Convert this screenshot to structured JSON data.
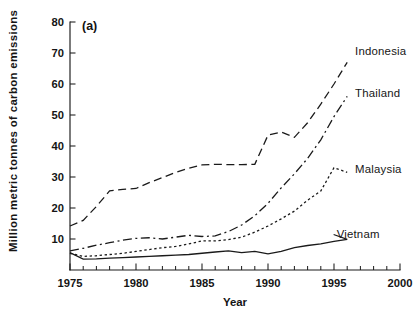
{
  "figure": {
    "panel_label": "(a)"
  },
  "chart_data": {
    "type": "line",
    "title": "",
    "panel": "(a)",
    "xlabel": "Year",
    "ylabel": "Million metric tonnes of carbon emissions",
    "xlim": [
      1975,
      2000
    ],
    "ylim": [
      0,
      80
    ],
    "xticks": [
      1975,
      1980,
      1985,
      1990,
      1995,
      2000
    ],
    "xticklabels": [
      "1975",
      "1980",
      "1985",
      "1990",
      "1995",
      "2000"
    ],
    "yticks": [
      10,
      20,
      30,
      40,
      50,
      60,
      70,
      80
    ],
    "yticklabels": [
      "10",
      "20",
      "30",
      "40",
      "50",
      "60",
      "70",
      "80"
    ],
    "x_minor_tick_interval": 1,
    "grid": false,
    "legend_position": "right-inline-labels",
    "series": [
      {
        "name": "Indonesia",
        "label": "Indonesia",
        "dash": "dashed",
        "label_x": 1996.6,
        "label_y": 70.5,
        "x": [
          1975,
          1976,
          1977,
          1978,
          1979,
          1980,
          1981,
          1982,
          1983,
          1984,
          1985,
          1986,
          1987,
          1988,
          1989,
          1990,
          1991,
          1992,
          1993,
          1994,
          1995,
          1996
        ],
        "values": [
          14.2,
          16.0,
          20.5,
          25.5,
          26.0,
          26.3,
          28.2,
          29.8,
          31.5,
          32.8,
          33.9,
          34.1,
          34.0,
          34.0,
          34.1,
          43.5,
          44.5,
          42.8,
          47.5,
          53.5,
          60.0,
          67.0
        ]
      },
      {
        "name": "Thailand",
        "label": "Thailand",
        "dash": "dash-dot",
        "label_x": 1996.6,
        "label_y": 57.0,
        "x": [
          1975,
          1976,
          1977,
          1978,
          1979,
          1980,
          1981,
          1982,
          1983,
          1984,
          1985,
          1986,
          1987,
          1988,
          1989,
          1990,
          1991,
          1992,
          1993,
          1994,
          1995,
          1996
        ],
        "values": [
          6.2,
          7.0,
          8.0,
          8.8,
          9.6,
          10.2,
          10.4,
          10.0,
          10.6,
          11.2,
          10.8,
          11.0,
          12.4,
          14.5,
          17.5,
          21.5,
          26.5,
          31.0,
          36.0,
          42.0,
          49.5,
          56.0
        ]
      },
      {
        "name": "Malaysia",
        "label": "Malaysia",
        "dash": "dotted",
        "label_x": 1996.6,
        "label_y": 32.5,
        "x": [
          1975,
          1976,
          1977,
          1978,
          1979,
          1980,
          1981,
          1982,
          1983,
          1984,
          1985,
          1986,
          1987,
          1988,
          1989,
          1990,
          1991,
          1992,
          1993,
          1994,
          1995,
          1996
        ],
        "values": [
          5.4,
          4.4,
          4.6,
          5.0,
          5.4,
          6.0,
          6.6,
          7.2,
          7.6,
          8.4,
          9.4,
          9.4,
          9.8,
          10.6,
          12.2,
          14.2,
          16.5,
          19.0,
          22.5,
          25.5,
          33.0,
          31.5
        ]
      },
      {
        "name": "Vietnam",
        "label": "Vietnam",
        "dash": "solid",
        "label_x": 1995.2,
        "label_y": 11.6,
        "x": [
          1975,
          1976,
          1977,
          1978,
          1979,
          1980,
          1981,
          1982,
          1983,
          1984,
          1985,
          1986,
          1987,
          1988,
          1989,
          1990,
          1991,
          1992,
          1993,
          1994,
          1995,
          1996
        ],
        "values": [
          5.6,
          3.5,
          3.6,
          3.8,
          4.0,
          4.2,
          4.4,
          4.6,
          4.8,
          5.0,
          5.4,
          5.8,
          6.2,
          5.6,
          6.0,
          5.2,
          6.0,
          7.2,
          7.9,
          8.4,
          9.2,
          9.9
        ]
      }
    ]
  },
  "plot_geometry": {
    "left": 70,
    "right": 400,
    "top": 22,
    "bottom": 270
  }
}
